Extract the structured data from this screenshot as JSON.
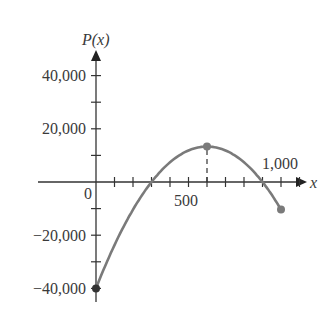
{
  "chart_data": {
    "type": "line",
    "title": "",
    "function_label": "P(x)",
    "xlabel": "x",
    "ylabel": "P(x)",
    "xlim": [
      -150,
      1150
    ],
    "ylim": [
      -45000,
      50000
    ],
    "grid": false,
    "x_ticks_step": 100,
    "y_ticks_step": 10000,
    "x_tick_labels": [
      {
        "value": 0,
        "label": "0"
      },
      {
        "value": 500,
        "label": "500"
      },
      {
        "value": 1000,
        "label": "1,000"
      }
    ],
    "y_tick_labels": [
      {
        "value": 40000,
        "label": "40,000"
      },
      {
        "value": 20000,
        "label": "20,000"
      },
      {
        "value": -20000,
        "label": "−20,000"
      },
      {
        "value": -40000,
        "label": "−40,000"
      }
    ],
    "series": [
      {
        "name": "P(x)",
        "color": "#7a7a7a",
        "x": [
          0,
          100,
          200,
          300,
          400,
          500,
          600,
          700,
          800,
          900,
          1000
        ],
        "values": [
          -40000,
          -23700,
          -10400,
          0,
          7400,
          11850,
          13333,
          11850,
          7400,
          0,
          -10370
        ]
      }
    ],
    "highlighted_points": [
      {
        "x": 0,
        "y": -40000,
        "label": "start"
      },
      {
        "x": 600,
        "y": 13333,
        "label": "maximum"
      },
      {
        "x": 1000,
        "y": -10370,
        "label": "end"
      }
    ],
    "annotations": [
      {
        "type": "dashed-vertical",
        "x": 600,
        "from": 0,
        "to": 13333
      }
    ]
  },
  "labels": {
    "y_axis": "P(x)",
    "x_axis": "x",
    "origin": "0",
    "x500": "500",
    "x1000": "1,000",
    "y40k": "40,000",
    "y20k": "20,000",
    "yn20k": "−20,000",
    "yn40k": "−40,000"
  }
}
